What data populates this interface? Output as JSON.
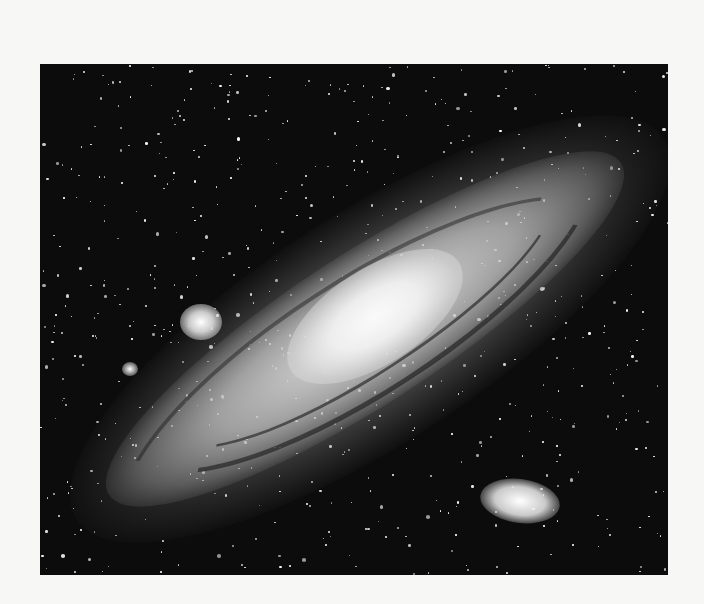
{
  "image": {
    "subject": "Andromeda Galaxy",
    "style": "black-and-white astronomical photograph",
    "features": [
      "spiral galaxy disk with dust lanes",
      "bright central core",
      "satellite galaxy upper-left",
      "elliptical satellite galaxy lower-right",
      "dense starfield"
    ],
    "colors": {
      "page_background": "#f7f7f5",
      "sky": "#0c0c0c",
      "star": "#ffffff",
      "galaxy_glow": "#d8d8d8"
    }
  },
  "starfield": {
    "count": 650,
    "seed": 1729
  }
}
